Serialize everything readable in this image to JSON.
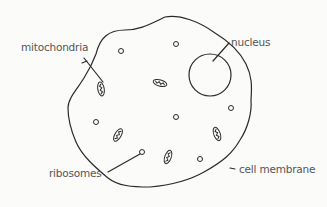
{
  "diagram": {
    "type": "animal cell",
    "labels": {
      "mitochondria": "mitochondria",
      "nucleus": "nucleus",
      "ribosomes": "ribosomes",
      "cell_membrane": "cell membrane"
    },
    "colors": {
      "stroke": "#2a2a2a",
      "label": "#555555",
      "background": "#fbfbfa"
    }
  }
}
